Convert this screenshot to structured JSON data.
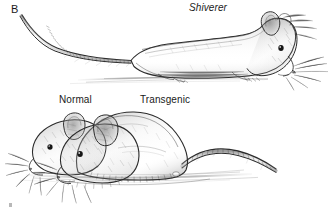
{
  "figure": {
    "panel_letter": "B",
    "background_color": "#ffffff",
    "ink_color": "#1a1a1a",
    "style": "pen-and-ink grayscale scientific illustration of laboratory mice"
  },
  "labels": {
    "shiverer": "Shiverer",
    "normal": "Normal",
    "transgenic": "Transgenic"
  },
  "subjects": [
    {
      "name": "shiverer-mouse",
      "label": "Shiverer",
      "description": "thin elongated mouse in profile facing right with long segmented tail curving up to the left"
    },
    {
      "name": "normal-mouse",
      "label": "Normal",
      "description": "smaller mouse head facing left positioned behind the transgenic mouse"
    },
    {
      "name": "transgenic-mouse",
      "label": "Transgenic",
      "description": "larger rounded-body mouse facing left with segmented tail curving to the right"
    }
  ]
}
